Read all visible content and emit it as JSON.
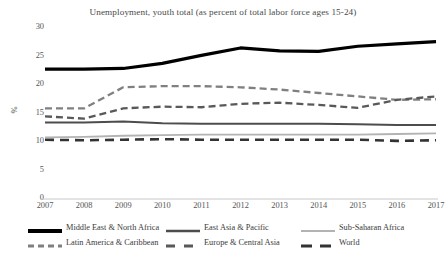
{
  "chart_data": {
    "type": "line",
    "title": "Unemployment, youth total (as percent of total labor force ages 15-24)",
    "xlabel": "",
    "ylabel": "%",
    "categories": [
      "2007",
      "2008",
      "2009",
      "2010",
      "2011",
      "2012",
      "2013",
      "2014",
      "2015",
      "2016",
      "2017"
    ],
    "ylim": [
      0,
      30
    ],
    "yticks": [
      "0",
      "5",
      "10",
      "15",
      "20",
      "25",
      "30"
    ],
    "grid": false,
    "legend_position": "bottom",
    "series": [
      {
        "name": "Middle East & North Africa",
        "style": "solid-thick",
        "color": "#000000",
        "values": [
          22.8,
          22.8,
          22.9,
          23.8,
          25.2,
          26.5,
          26.0,
          25.9,
          26.8,
          27.2,
          27.6
        ]
      },
      {
        "name": "East Asia & Pacific",
        "style": "solid-medium",
        "color": "#4d4d4d",
        "values": [
          13.4,
          13.4,
          13.6,
          13.3,
          13.2,
          13.2,
          13.2,
          13.2,
          13.1,
          13.0,
          13.0
        ]
      },
      {
        "name": "Sub-Saharan Africa",
        "style": "solid-light",
        "color": "#b3b3b3",
        "values": [
          10.8,
          10.9,
          11.1,
          11.2,
          11.3,
          11.3,
          11.3,
          11.3,
          11.3,
          11.4,
          11.5
        ]
      },
      {
        "name": "Latin America & Caribbean",
        "style": "dashed",
        "color": "#808080",
        "values": [
          15.9,
          15.9,
          19.6,
          19.8,
          19.8,
          19.6,
          19.2,
          18.6,
          18.0,
          17.4,
          17.5
        ]
      },
      {
        "name": "Europe & Central Asia",
        "style": "dashed",
        "color": "#595959",
        "values": [
          14.5,
          14.1,
          15.9,
          16.2,
          16.1,
          16.7,
          16.9,
          16.5,
          16.0,
          17.4,
          18.0
        ]
      },
      {
        "name": "World",
        "style": "dashed-dark",
        "color": "#333333",
        "values": [
          10.4,
          10.3,
          10.4,
          10.5,
          10.4,
          10.4,
          10.4,
          10.4,
          10.4,
          10.2,
          10.3
        ]
      }
    ]
  },
  "legend": {
    "items": [
      {
        "label": "Middle East & North Africa"
      },
      {
        "label": "East Asia & Pacific"
      },
      {
        "label": "Sub-Saharan Africa"
      },
      {
        "label": "Latin America & Caribbean"
      },
      {
        "label": "Europe & Central Asia"
      },
      {
        "label": "World"
      }
    ]
  }
}
